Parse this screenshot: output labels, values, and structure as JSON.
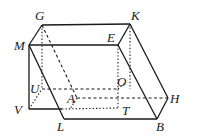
{
  "figure": {
    "colors": {
      "stroke": "#1a1a1a",
      "background": "#ffffff"
    },
    "labels": {
      "G": "G",
      "K": "K",
      "M": "M",
      "E": "E",
      "U": "U",
      "O": "O",
      "A": "A",
      "H": "H",
      "V": "V",
      "L": "L",
      "T": "T",
      "B": "B"
    }
  }
}
